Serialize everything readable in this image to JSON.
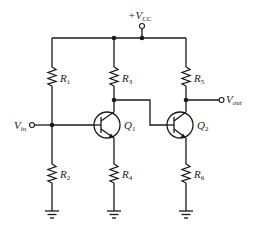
{
  "diagram": {
    "type": "circuit-schematic",
    "supply": {
      "label": "+V",
      "sub": "CC"
    },
    "input": {
      "label": "V",
      "sub": "in"
    },
    "output": {
      "label": "V",
      "sub": "out"
    },
    "resistors": [
      {
        "id": "R1",
        "label": "R",
        "sub": "1"
      },
      {
        "id": "R2",
        "label": "R",
        "sub": "2"
      },
      {
        "id": "R3",
        "label": "R",
        "sub": "3"
      },
      {
        "id": "R4",
        "label": "R",
        "sub": "4"
      },
      {
        "id": "R5",
        "label": "R",
        "sub": "5"
      },
      {
        "id": "R6",
        "label": "R",
        "sub": "6"
      }
    ],
    "transistors": [
      {
        "id": "Q1",
        "label": "Q",
        "sub": "1",
        "kind": "NPN"
      },
      {
        "id": "Q2",
        "label": "Q",
        "sub": "2",
        "kind": "NPN"
      }
    ],
    "grounds": 3,
    "colors": {
      "ink": "#1a1a1a",
      "background": "#ffffff"
    }
  }
}
